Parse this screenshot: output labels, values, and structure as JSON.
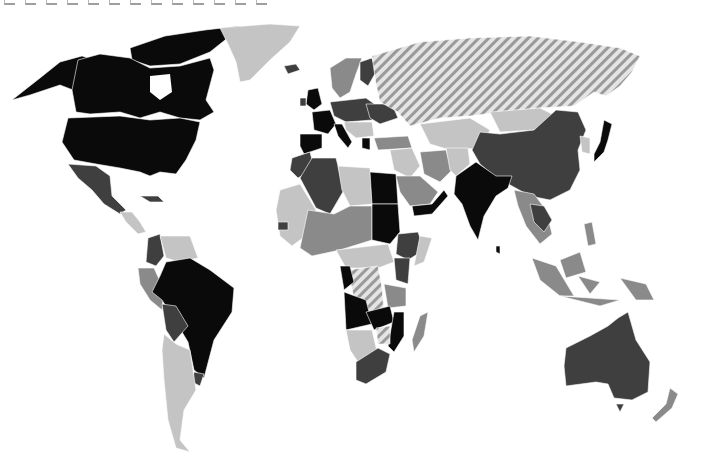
{
  "caption": {
    "text": "",
    "note": "caption text cropped at top edge; not legible"
  },
  "map": {
    "type": "choropleth",
    "projection": "world (Robinson-like)",
    "palette": {
      "class_1": "#0a0a0a",
      "class_2": "#3f3f3f",
      "class_3": "#8a8a8a",
      "class_4": "#c4c4c4",
      "hatched": "#b0b0b0",
      "ocean": "#ffffff"
    },
    "regions": [
      {
        "name": "Canada",
        "class": "class_1"
      },
      {
        "name": "United States",
        "class": "class_1"
      },
      {
        "name": "Alaska",
        "class": "class_1"
      },
      {
        "name": "Greenland",
        "class": "class_4"
      },
      {
        "name": "Iceland",
        "class": "class_2"
      },
      {
        "name": "Mexico",
        "class": "class_2"
      },
      {
        "name": "Central America",
        "class": "class_4"
      },
      {
        "name": "Cuba",
        "class": "class_2"
      },
      {
        "name": "Colombia",
        "class": "class_2"
      },
      {
        "name": "Venezuela",
        "class": "class_4"
      },
      {
        "name": "Brazil",
        "class": "class_1"
      },
      {
        "name": "Peru",
        "class": "class_3"
      },
      {
        "name": "Bolivia",
        "class": "class_2"
      },
      {
        "name": "Argentina",
        "class": "class_4"
      },
      {
        "name": "Chile",
        "class": "class_4"
      },
      {
        "name": "Uruguay",
        "class": "class_2"
      },
      {
        "name": "United Kingdom",
        "class": "class_1"
      },
      {
        "name": "France",
        "class": "class_1"
      },
      {
        "name": "Spain",
        "class": "class_1"
      },
      {
        "name": "Italy",
        "class": "class_1"
      },
      {
        "name": "Greece",
        "class": "class_1"
      },
      {
        "name": "Scandinavia",
        "class": "class_3"
      },
      {
        "name": "Finland",
        "class": "class_2"
      },
      {
        "name": "Central Europe",
        "class": "class_2"
      },
      {
        "name": "Ukraine",
        "class": "class_2"
      },
      {
        "name": "Russia",
        "class": "hatched"
      },
      {
        "name": "Turkey",
        "class": "class_3"
      },
      {
        "name": "Middle East",
        "class": "class_4"
      },
      {
        "name": "Iran",
        "class": "class_3"
      },
      {
        "name": "Central Asia",
        "class": "class_4"
      },
      {
        "name": "Mongolia",
        "class": "class_4"
      },
      {
        "name": "China",
        "class": "class_2"
      },
      {
        "name": "Japan",
        "class": "class_1"
      },
      {
        "name": "India",
        "class": "class_1"
      },
      {
        "name": "Southeast Asia",
        "class": "class_3"
      },
      {
        "name": "Indonesia",
        "class": "class_3"
      },
      {
        "name": "Papua New Guinea",
        "class": "class_3"
      },
      {
        "name": "Australia",
        "class": "class_2"
      },
      {
        "name": "New Zealand",
        "class": "class_3"
      },
      {
        "name": "Morocco",
        "class": "class_2"
      },
      {
        "name": "Algeria",
        "class": "class_2"
      },
      {
        "name": "Libya",
        "class": "class_4"
      },
      {
        "name": "Egypt",
        "class": "class_1"
      },
      {
        "name": "Sudan",
        "class": "class_1"
      },
      {
        "name": "West Africa",
        "class": "class_3"
      },
      {
        "name": "Ethiopia",
        "class": "class_2"
      },
      {
        "name": "Kenya",
        "class": "class_2"
      },
      {
        "name": "DR Congo",
        "class": "hatched"
      },
      {
        "name": "Angola",
        "class": "class_1"
      },
      {
        "name": "Zambia",
        "class": "class_1"
      },
      {
        "name": "Mozambique",
        "class": "class_1"
      },
      {
        "name": "Namibia",
        "class": "class_4"
      },
      {
        "name": "Botswana",
        "class": "class_4"
      },
      {
        "name": "Zimbabwe",
        "class": "hatched"
      },
      {
        "name": "South Africa",
        "class": "class_2"
      },
      {
        "name": "Madagascar",
        "class": "class_3"
      },
      {
        "name": "Saudi Arabia",
        "class": "class_3"
      },
      {
        "name": "Yemen",
        "class": "class_1"
      }
    ]
  }
}
